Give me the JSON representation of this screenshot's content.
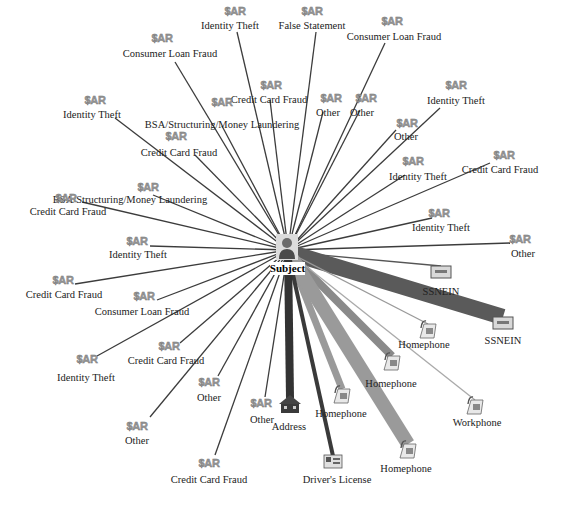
{
  "center": {
    "label": "Subject",
    "icon": "person-icon"
  },
  "sar_badge": "$AR",
  "sar_nodes": [
    {
      "category": "Identity Theft"
    },
    {
      "category": "False Statement"
    },
    {
      "category": "Consumer Loan Fraud"
    },
    {
      "category": "Consumer Loan Fraud"
    },
    {
      "category": "Credit Card Fraud"
    },
    {
      "category": "Other"
    },
    {
      "category": "Identity Theft"
    },
    {
      "category": "BSA/Structuring/Money Laundering"
    },
    {
      "category": "Other"
    },
    {
      "category": "Identity Theft"
    },
    {
      "category": "Other"
    },
    {
      "category": "Credit Card Fraud"
    },
    {
      "category": "Identity Theft"
    },
    {
      "category": "Credit Card Fraud"
    },
    {
      "category": "BSA/Structuring/Money Laundering"
    },
    {
      "category": "Credit Card Fraud"
    },
    {
      "category": "Identity Theft"
    },
    {
      "category": "Identity Theft"
    },
    {
      "category": "Other"
    },
    {
      "category": "Credit Card Fraud"
    },
    {
      "category": "Consumer Loan Fraud"
    },
    {
      "category": "Identity Theft"
    },
    {
      "category": "Credit Card Fraud"
    },
    {
      "category": "Other"
    },
    {
      "category": "Other"
    },
    {
      "category": "Other"
    },
    {
      "category": "Credit Card Fraud"
    }
  ],
  "entity_nodes": [
    {
      "label": "SSNEIN",
      "icon": "id-card-icon",
      "link_weight": "thin",
      "link_color": "#555555"
    },
    {
      "label": "SSNEIN",
      "icon": "id-card-icon",
      "link_weight": "heavy",
      "link_color": "#5a5a5a"
    },
    {
      "label": "Homephone",
      "icon": "telephone-icon",
      "link_weight": "thin",
      "link_color": "#9a9a9a"
    },
    {
      "label": "Homephone",
      "icon": "telephone-icon",
      "link_weight": "medium",
      "link_color": "#8a8a8a"
    },
    {
      "label": "Workphone",
      "icon": "telephone-icon",
      "link_weight": "thin",
      "link_color": "#aaaaaa"
    },
    {
      "label": "Homephone",
      "icon": "telephone-icon",
      "link_weight": "medium",
      "link_color": "#9a9a9a"
    },
    {
      "label": "Homephone",
      "icon": "telephone-icon",
      "link_weight": "heavy",
      "link_color": "#9a9a9a"
    },
    {
      "label": "Driver's License",
      "icon": "drivers-license-icon",
      "link_weight": "thin-dark",
      "link_color": "#3a3a3a"
    },
    {
      "label": "Address",
      "icon": "house-icon",
      "link_weight": "thick-dark",
      "link_color": "#333333"
    }
  ]
}
